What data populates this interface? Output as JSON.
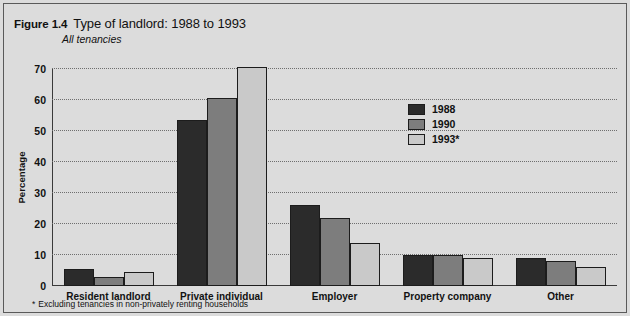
{
  "figure": {
    "number": "Figure 1.4",
    "title": "Type of landlord: 1988 to 1993",
    "subtitle": "All tenancies",
    "footnote_marker": "*",
    "footnote": "Excluding tenancies in non-privately renting households"
  },
  "colors": {
    "series_1988": "#2b2b2b",
    "series_1990": "#7d7d7d",
    "series_1993": "#c9c9c9",
    "panel_background": "#dcdcdc",
    "axis": "#3a3a3a",
    "gridline": "#6e6e6e"
  },
  "chart_data": {
    "type": "bar",
    "title": "Type of landlord: 1988 to 1993",
    "subtitle": "All tenancies",
    "xlabel": "",
    "ylabel": "Percentage",
    "ylim": [
      0,
      70
    ],
    "yticks": [
      0,
      10,
      20,
      30,
      40,
      50,
      60,
      70
    ],
    "ytick_labels": [
      "0",
      "10",
      "20",
      "30",
      "40",
      "50",
      "60",
      "70"
    ],
    "grid": true,
    "legend_position": "center-right",
    "categories": [
      "Resident landlord",
      "Private individual",
      "Employer",
      "Property company",
      "Other"
    ],
    "series": [
      {
        "name": "1988",
        "color": "#2b2b2b",
        "values": [
          5.5,
          53.5,
          26,
          10,
          9
        ]
      },
      {
        "name": "1990",
        "color": "#7d7d7d",
        "values": [
          3,
          60.5,
          22,
          10,
          8
        ]
      },
      {
        "name": "1993*",
        "color": "#c9c9c9",
        "values": [
          4.5,
          70.5,
          14,
          9,
          6
        ]
      }
    ],
    "annotations": [
      "* Excluding tenancies in non-privately renting households"
    ]
  }
}
